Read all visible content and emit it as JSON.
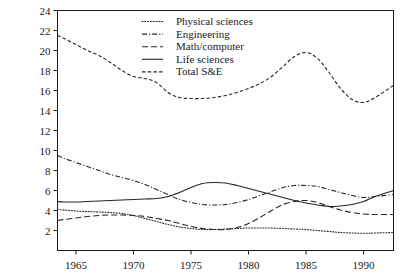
{
  "chart_data": {
    "type": "line",
    "title": "",
    "subtitle": "",
    "xlabel": "",
    "ylabel": "",
    "xlim": [
      1963.4,
      1992.6
    ],
    "ylim": [
      0,
      24
    ],
    "grid": false,
    "legend_position": "top-center",
    "x_ticks": [
      1965,
      1970,
      1975,
      1980,
      1985,
      1990
    ],
    "x_tick_labels": [
      "1965",
      "1970",
      "1975",
      "1980",
      "1985",
      "1990"
    ],
    "y_ticks": [
      2,
      4,
      6,
      8,
      10,
      12,
      14,
      16,
      18,
      20,
      22,
      24
    ],
    "y_tick_labels": [
      "2",
      "4",
      "6",
      "8",
      "10",
      "12",
      "14",
      "16",
      "18",
      "20",
      "22",
      "24"
    ],
    "x": [
      1963.4,
      1964,
      1965,
      1966,
      1967,
      1968,
      1969,
      1970,
      1971,
      1972,
      1973,
      1974,
      1975,
      1976,
      1977,
      1978,
      1979,
      1980,
      1981,
      1982,
      1983,
      1984,
      1985,
      1986,
      1987,
      1988,
      1989,
      1990,
      1991,
      1992.6
    ],
    "series": [
      {
        "name": "Physical sciences",
        "style": "dotted",
        "dasharray": "1,1.8",
        "values": [
          4.1,
          4.05,
          3.95,
          3.9,
          3.85,
          3.8,
          3.7,
          3.5,
          3.2,
          2.9,
          2.6,
          2.35,
          2.2,
          2.1,
          2.1,
          2.15,
          2.2,
          2.25,
          2.25,
          2.25,
          2.2,
          2.15,
          2.1,
          2.0,
          1.9,
          1.8,
          1.75,
          1.72,
          1.75,
          1.8
        ]
      },
      {
        "name": "Engineering",
        "style": "dashdot",
        "dasharray": "5,2,1.2,2",
        "values": [
          9.5,
          9.2,
          8.8,
          8.4,
          8.0,
          7.6,
          7.3,
          7.0,
          6.6,
          6.1,
          5.6,
          5.1,
          4.8,
          4.6,
          4.55,
          4.6,
          4.8,
          5.1,
          5.5,
          5.9,
          6.3,
          6.5,
          6.5,
          6.4,
          6.1,
          5.8,
          5.5,
          5.3,
          5.4,
          5.6
        ]
      },
      {
        "name": "Math/computer",
        "style": "dashed-long",
        "dasharray": "6,3",
        "values": [
          3.0,
          3.1,
          3.25,
          3.4,
          3.5,
          3.55,
          3.55,
          3.5,
          3.4,
          3.2,
          3.0,
          2.7,
          2.4,
          2.2,
          2.1,
          2.1,
          2.3,
          2.7,
          3.3,
          4.0,
          4.6,
          4.9,
          5.0,
          4.8,
          4.4,
          4.05,
          3.8,
          3.65,
          3.6,
          3.6
        ]
      },
      {
        "name": "Life sciences",
        "style": "solid",
        "dasharray": "",
        "values": [
          4.9,
          4.85,
          4.85,
          4.9,
          4.95,
          5.0,
          5.05,
          5.1,
          5.15,
          5.2,
          5.4,
          5.8,
          6.3,
          6.7,
          6.8,
          6.75,
          6.5,
          6.2,
          5.9,
          5.6,
          5.3,
          5.0,
          4.75,
          4.55,
          4.4,
          4.45,
          4.6,
          4.9,
          5.4,
          6.0
        ]
      },
      {
        "name": "Total S&E",
        "style": "dashed",
        "dasharray": "3.5,2.2",
        "values": [
          21.5,
          21.2,
          20.6,
          20.0,
          19.5,
          18.8,
          18.0,
          17.4,
          17.2,
          16.8,
          15.8,
          15.3,
          15.2,
          15.2,
          15.3,
          15.5,
          15.8,
          16.2,
          16.7,
          17.4,
          18.4,
          19.4,
          19.8,
          19.2,
          17.8,
          16.2,
          15.1,
          14.8,
          15.3,
          16.5
        ]
      }
    ]
  },
  "legend": {
    "entries": [
      {
        "label": "Physical sciences"
      },
      {
        "label": "Engineering"
      },
      {
        "label": "Math/computer"
      },
      {
        "label": "Life sciences"
      },
      {
        "label": "Total S&E"
      }
    ]
  }
}
